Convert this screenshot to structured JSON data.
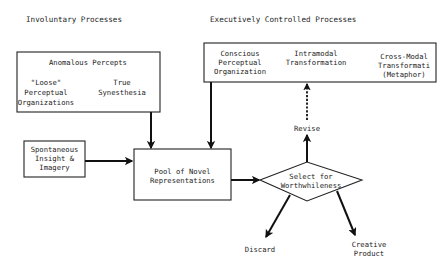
{
  "headers": {
    "involuntary": "Involuntary Processes",
    "executive": "Executively Controlled Processes"
  },
  "anomalous_box": {
    "title": "Anomalous Percepts",
    "left": [
      "\"Loose\"",
      "Perceptual",
      "Organizations"
    ],
    "right": [
      "True",
      "Synesthesia"
    ]
  },
  "executive_box": {
    "items": [
      [
        "Conscious",
        "Perceptual",
        "Organization"
      ],
      [
        "Intramodal",
        "Transformation"
      ],
      [
        "Cross-Modal",
        "Transformati",
        "(Metaphor)"
      ]
    ]
  },
  "spontaneous_box": {
    "lines": [
      "Spontaneous",
      "Insight &",
      "Imagery"
    ]
  },
  "pool_box": {
    "lines": [
      "Pool of Novel",
      "Representations"
    ]
  },
  "select_diamond": {
    "lines": [
      "Select for",
      "Worthwhileness"
    ]
  },
  "outcomes": {
    "revise": "Revise",
    "discard": "Discard",
    "creative": [
      "Creative",
      "Product"
    ]
  },
  "colors": {
    "ink": "#1c1c1c",
    "background": "#ffffff"
  }
}
